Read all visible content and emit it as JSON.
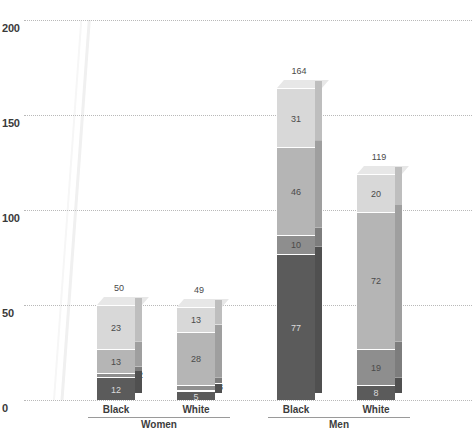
{
  "chart_data": {
    "type": "bar",
    "subtype": "stacked-3d-column",
    "title": "",
    "xlabel": "",
    "ylabel": "",
    "ylim": [
      0,
      200
    ],
    "yticks": [
      0,
      50,
      100,
      150,
      200
    ],
    "grid": true,
    "legend_position": "none",
    "groups": [
      "Women",
      "Men"
    ],
    "categories": [
      "Black",
      "White",
      "Black",
      "White"
    ],
    "totals": [
      50,
      49,
      164,
      119
    ],
    "series": [
      {
        "name": "segment-1-bottom",
        "color": "#5b5b5b",
        "values": [
          12,
          5,
          77,
          8
        ]
      },
      {
        "name": "segment-2",
        "color": "#8e8e8e",
        "values": [
          2,
          3,
          10,
          19
        ]
      },
      {
        "name": "segment-3",
        "color": "#b5b5b5",
        "values": [
          13,
          28,
          46,
          72
        ]
      },
      {
        "name": "segment-4-top",
        "color": "#d8d8d8",
        "values": [
          23,
          13,
          31,
          20
        ]
      }
    ],
    "bars": [
      {
        "group": "Women",
        "category": "Black",
        "total": 50,
        "segments": [
          {
            "value": 23,
            "color": "#d8d8d8",
            "label_outside": false
          },
          {
            "value": 13,
            "color": "#b5b5b5",
            "label_outside": false
          },
          {
            "value": 2,
            "color": "#8e8e8e",
            "label_outside": true
          },
          {
            "value": 12,
            "color": "#5b5b5b",
            "label_outside": false
          }
        ]
      },
      {
        "group": "Women",
        "category": "White",
        "total": 49,
        "segments": [
          {
            "value": 13,
            "color": "#d8d8d8",
            "label_outside": false
          },
          {
            "value": 28,
            "color": "#b5b5b5",
            "label_outside": false
          },
          {
            "value": 3,
            "color": "#8e8e8e",
            "label_outside": true
          },
          {
            "value": 5,
            "color": "#5b5b5b",
            "label_outside": false
          }
        ]
      },
      {
        "group": "Men",
        "category": "Black",
        "total": 164,
        "segments": [
          {
            "value": 31,
            "color": "#d8d8d8",
            "label_outside": false
          },
          {
            "value": 46,
            "color": "#b5b5b5",
            "label_outside": false
          },
          {
            "value": 10,
            "color": "#8e8e8e",
            "label_outside": false
          },
          {
            "value": 77,
            "color": "#5b5b5b",
            "label_outside": false
          }
        ]
      },
      {
        "group": "Men",
        "category": "White",
        "total": 119,
        "segments": [
          {
            "value": 20,
            "color": "#d8d8d8",
            "label_outside": false
          },
          {
            "value": 72,
            "color": "#b5b5b5",
            "label_outside": false
          },
          {
            "value": 19,
            "color": "#8e8e8e",
            "label_outside": false
          },
          {
            "value": 8,
            "color": "#5b5b5b",
            "label_outside": false
          }
        ]
      }
    ]
  },
  "axis": {
    "y_labels": [
      "200",
      "150",
      "100",
      "50",
      "0"
    ],
    "y_values": [
      200,
      150,
      100,
      50,
      0
    ]
  },
  "categories_axis": {
    "items": [
      {
        "label": "Black",
        "group": "Women"
      },
      {
        "label": "White",
        "group": "Women"
      },
      {
        "label": "Black",
        "group": "Men"
      },
      {
        "label": "White",
        "group": "Men"
      }
    ],
    "groups": [
      {
        "label": "Women"
      },
      {
        "label": "Men"
      }
    ]
  },
  "colors": {
    "segment_top": "#d8d8d8",
    "segment_upper_mid": "#b5b5b5",
    "segment_lower_mid": "#8e8e8e",
    "segment_bottom": "#5b5b5b",
    "gridline": "#b9b9b9",
    "axis_text": "#3a3a3a",
    "label_text": "#4a4a4a"
  }
}
